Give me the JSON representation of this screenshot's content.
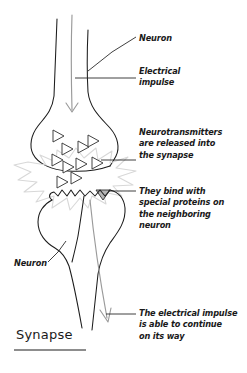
{
  "diagram": {
    "title": "Synapse",
    "background_color": "#ffffff",
    "ink_color": "#1c1c1c",
    "impulse_color": "#9a9a9a",
    "burst_color": "#d8d8d8",
    "labels": {
      "neuron_top": [
        "Neuron"
      ],
      "electrical_impulse": [
        "Electrical",
        "impulse"
      ],
      "neurotransmitters": [
        "Neurotransmitters",
        "are released into",
        "the synapse"
      ],
      "binding": [
        "They bind with",
        "special proteins on",
        "the neighboring",
        "neuron"
      ],
      "neuron_bottom": [
        "Neuron"
      ],
      "continue": [
        "The electrical impulse",
        "is able to continue",
        "on its way"
      ]
    }
  }
}
